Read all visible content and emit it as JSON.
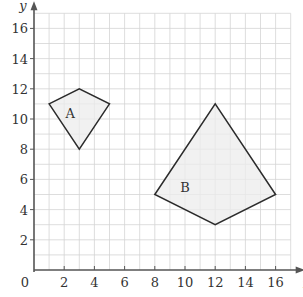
{
  "diagram": {
    "type": "coordinate-grid",
    "x_axis": {
      "label": "x",
      "min": 0,
      "max": 17,
      "ticks": [
        0,
        2,
        4,
        6,
        8,
        10,
        12,
        14,
        16
      ]
    },
    "y_axis": {
      "label": "y",
      "min": 0,
      "max": 17,
      "ticks": [
        2,
        4,
        6,
        8,
        10,
        12,
        14,
        16
      ]
    },
    "origin_label": "0",
    "grid_step": 1,
    "shapes": [
      {
        "label": "A",
        "vertices": [
          [
            1,
            11
          ],
          [
            3,
            12
          ],
          [
            5,
            11
          ],
          [
            3,
            8
          ]
        ],
        "label_pos": [
          2.4,
          10.4
        ]
      },
      {
        "label": "B",
        "vertices": [
          [
            8,
            5
          ],
          [
            12,
            11
          ],
          [
            16,
            5
          ],
          [
            12,
            3
          ]
        ],
        "label_pos": [
          10,
          5.5
        ]
      }
    ],
    "colors": {
      "grid": "#d4d4d4",
      "axis": "#555555",
      "outline": "#2b2b2b",
      "fill": "#ececec"
    }
  }
}
